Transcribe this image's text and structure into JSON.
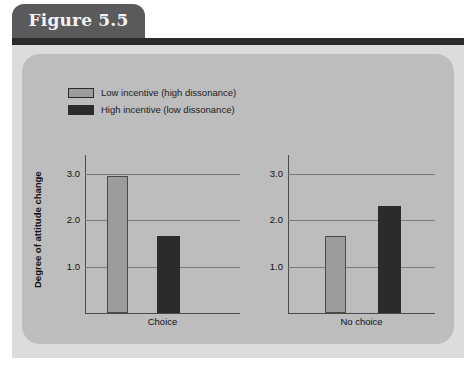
{
  "figure": {
    "tab_label": "Figure 5.5"
  },
  "chart_data": {
    "type": "bar",
    "title": "Figure 5.5",
    "xlabel": "",
    "ylabel": "Degree of attitude change",
    "ylim": [
      0,
      3.4
    ],
    "yticks": [
      "1.0",
      "2.0",
      "3.0"
    ],
    "ytick_values": [
      1.0,
      2.0,
      3.0
    ],
    "grid": true,
    "legend_position": "top-left",
    "panels": [
      "Choice",
      "No choice"
    ],
    "categories": [
      "Choice",
      "No choice"
    ],
    "series": [
      {
        "name": "Low incentive (high dissonance)",
        "color": "#9c9c9c",
        "values": [
          2.95,
          1.65
        ]
      },
      {
        "name": "High incentive (low dissonance)",
        "color": "#2b2b2d",
        "values": [
          1.65,
          2.3
        ]
      }
    ]
  }
}
